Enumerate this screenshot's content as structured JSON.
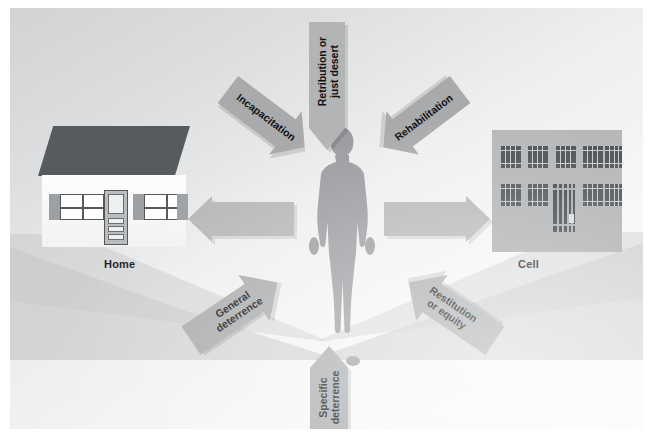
{
  "diagram": {
    "nodes": {
      "home_label": "Home",
      "cell_label": "Cell",
      "person_label": "offender"
    },
    "arrows": [
      {
        "id": "retribution",
        "label": "Retribution or\njust desert",
        "line1": "Retribution or",
        "line2": "just desert",
        "direction": "down",
        "target": "offender"
      },
      {
        "id": "incapacitation",
        "label": "Incapacitation",
        "line1": "Incapacitation",
        "line2": "",
        "direction": "down-right",
        "target": "offender"
      },
      {
        "id": "rehabilitation",
        "label": "Rehabilitation",
        "line1": "Rehabilitation",
        "line2": "",
        "direction": "down-left",
        "target": "offender"
      },
      {
        "id": "general-deterrence",
        "label": "General\ndeterrence",
        "line1": "General",
        "line2": "deterrence",
        "direction": "up-right",
        "target": "offender"
      },
      {
        "id": "restitution-equity",
        "label": "Restitution\nor equity",
        "line1": "Restitution",
        "line2": "or equity",
        "direction": "up-left",
        "target": "offender"
      },
      {
        "id": "specific-deterrence",
        "label": "Specific\ndeterrence",
        "line1": "Specific",
        "line2": "deterrence",
        "direction": "up",
        "target": "offender"
      },
      {
        "id": "to-home",
        "label": "",
        "line1": "",
        "line2": "",
        "direction": "left",
        "target": "home"
      },
      {
        "id": "to-cell",
        "label": "",
        "line1": "",
        "line2": "",
        "direction": "right",
        "target": "cell"
      }
    ],
    "colors": {
      "background": "#e9eaea",
      "arrow_fill": "#a8aaac",
      "roof": "#585b5e",
      "figure": "#9a9c9f",
      "cell_wall": "#adafb1",
      "bars": "#4a4d50",
      "text": "#111111"
    }
  }
}
